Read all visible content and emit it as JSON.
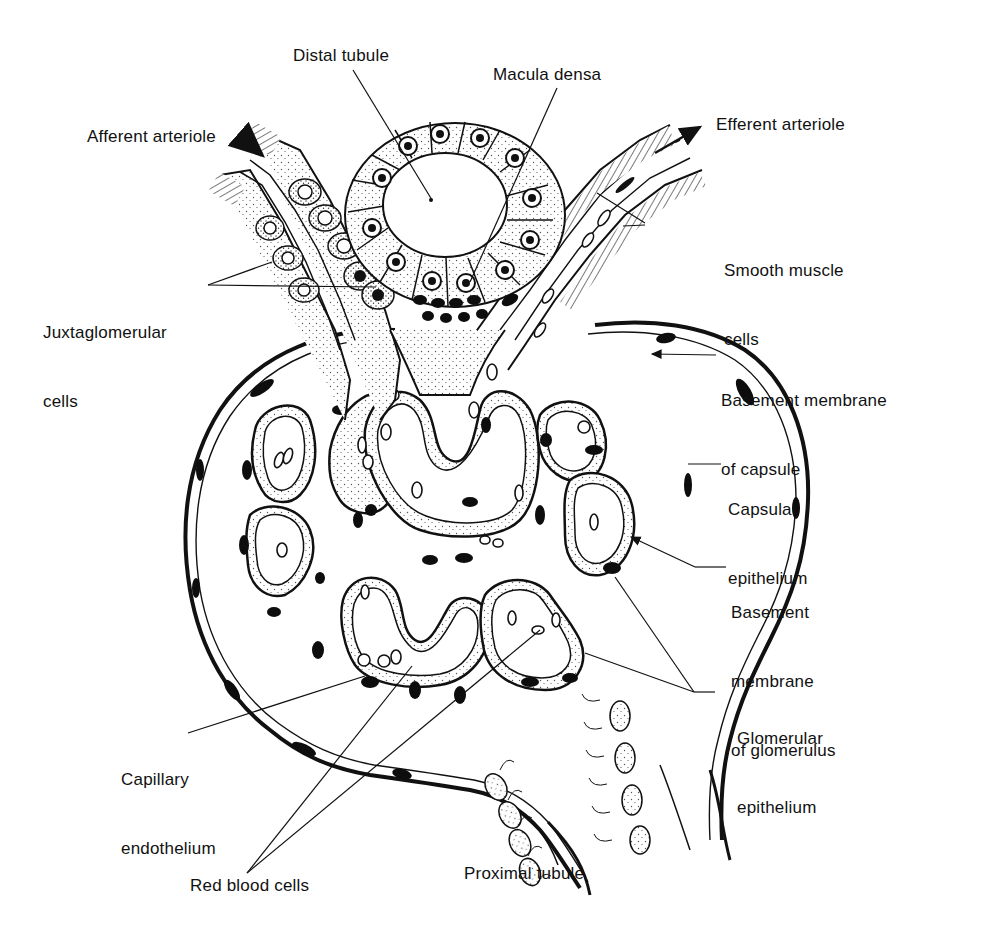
{
  "figure": {
    "colors": {
      "ink": "#111111",
      "paper": "#ffffff",
      "stipple": "#555555",
      "nucleus": "#0d0d0d"
    },
    "labels": {
      "distal_tubule": "Distal tubule",
      "macula_densa": "Macula densa",
      "afferent_arteriole": "Afferent arteriole",
      "efferent_arteriole": "Efferent arteriole",
      "smooth_muscle_1": "Smooth muscle",
      "smooth_muscle_2": "cells",
      "juxtaglomerular_1": "Juxtaglomerular",
      "juxtaglomerular_2": "cells",
      "bm_capsule_1": "Basement membrane",
      "bm_capsule_2": "of capsule",
      "capsular_epi_1": "Capsular",
      "capsular_epi_2": "epithelium",
      "bm_glom_1": "Basement",
      "bm_glom_2": "membrane",
      "bm_glom_3": "of glomerulus",
      "glom_epi_1": "Glomerular",
      "glom_epi_2": "epithelium",
      "cap_endo_1": "Capillary",
      "cap_endo_2": "endothelium",
      "red_blood_cells": "Red blood cells",
      "proximal_tubule": "Proximal tubule"
    }
  }
}
